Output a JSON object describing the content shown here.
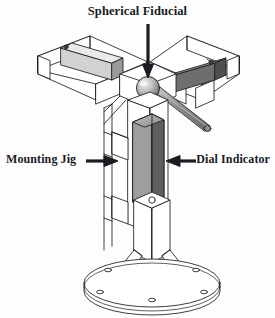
{
  "figure": {
    "background_color": "#fdfdfd",
    "line_color": "#1b1b22",
    "labels": {
      "spherical_fiducial": "Spherical Fiducial",
      "mounting_jig": "Mounting Jig",
      "dial_indicator": "Dial Indicator"
    },
    "parts": {
      "left_arm": "left-beam-arm",
      "right_arm": "right-beam-arm",
      "left_rail": "left-rail-light-gray",
      "right_rail": "right-rail-dark-gray",
      "sphere": "spherical-fiducial-ball",
      "probe_rod": "diagonal-probe-rod",
      "dial_body": "dial-indicator-body",
      "column": "mounting-jig-column",
      "gussets": "triangular-gusset-supports",
      "base": "circular-base-plate"
    },
    "colors": {
      "rail_light": "#d2d2d2",
      "rail_dark": "#6e6e6e",
      "rail_mid": "#9a9a9a",
      "dial_face": "#8c8c8c",
      "dial_side": "#5f5f5f",
      "sphere_light": "#e8e8e8",
      "sphere_dark": "#777777",
      "rod": "#8f8f8f",
      "white_face": "#ffffff",
      "ink": "#1b1b22"
    }
  }
}
